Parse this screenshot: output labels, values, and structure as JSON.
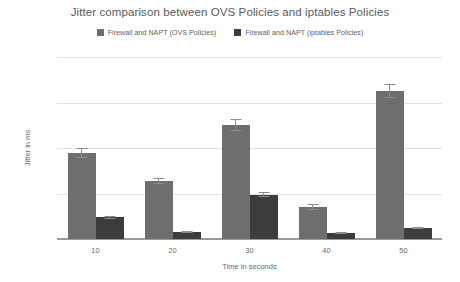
{
  "chart_data": {
    "type": "bar",
    "title": "Jitter comparison between OVS Policies and iptables Policies",
    "xlabel": "Time in seconds",
    "ylabel": "Jitter in ms",
    "categories": [
      "10",
      "20",
      "30",
      "40",
      "50"
    ],
    "ylim": [
      0.0,
      0.008
    ],
    "yticks": [
      "0.000",
      "0.002",
      "0.004",
      "0.006",
      "0.008"
    ],
    "ytick_values": [
      0.0,
      0.002,
      0.004,
      0.006,
      0.008
    ],
    "grid": true,
    "legend_position": "top-center",
    "series": [
      {
        "name": "Firewall and NAPT (OVS Policies)",
        "color": "#6e6e6e",
        "values": [
          0.0038,
          0.00255,
          0.005,
          0.0014,
          0.0065
        ],
        "errors": [
          0.00022,
          0.00014,
          0.00026,
          0.00013,
          0.0003
        ]
      },
      {
        "name": "Firewall and NAPT (iptables Policies)",
        "color": "#3c3c3c",
        "values": [
          0.00095,
          0.0003,
          0.00195,
          0.00028,
          0.00048
        ],
        "errors": [
          8e-05,
          4e-05,
          0.00012,
          4e-05,
          5e-05
        ]
      }
    ]
  }
}
